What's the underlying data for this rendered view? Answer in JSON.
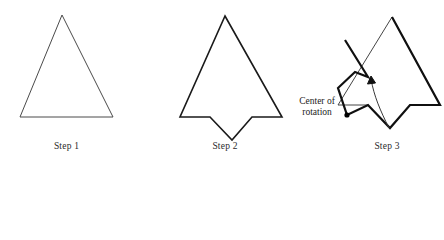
{
  "figure": {
    "kind": "rotation-steps-diagram",
    "background_color": "#ffffff",
    "stroke_color": "#1a1a1a",
    "thin_stroke_color": "#3a3a3a"
  },
  "labels": {
    "step1": "Step 1",
    "step2": "Step 2",
    "step3": "Step 3",
    "center_of_rotation": "Center of rotation"
  },
  "shapes": {
    "step1_triangle": {
      "name": "triangle",
      "points": "62,15 113,117 20,117",
      "stroke_width": 1
    },
    "step2_notched_triangle": {
      "name": "notched-triangle",
      "points": "225,16 282,117 252,117 232,140 210,117 180,117",
      "stroke_width": 1.6
    },
    "step3_ghost_outline": {
      "name": "original-position-outline",
      "points": "392,17 440,105 410,105 390,128 368,105 338,105",
      "stroke_width": 1
    },
    "step3_rotated_outline": {
      "name": "rotated-shape-outline",
      "points": "392,17 440,105 410,105 390,128 368,105 347,115 338,88 355,72 368,77 345,40",
      "stroke_width": 2.2
    }
  },
  "annotations": {
    "center_dot": {
      "name": "center-of-rotation-dot",
      "cx": 347,
      "cy": 115,
      "r": 2.6
    },
    "rotation_arrow": {
      "name": "rotation-arc-arrow",
      "path": "M 389,128 C 380,110 374,96 371,79",
      "arrow_points": "371,76 367.5,84 375.5,83",
      "stroke_width": 1
    }
  }
}
